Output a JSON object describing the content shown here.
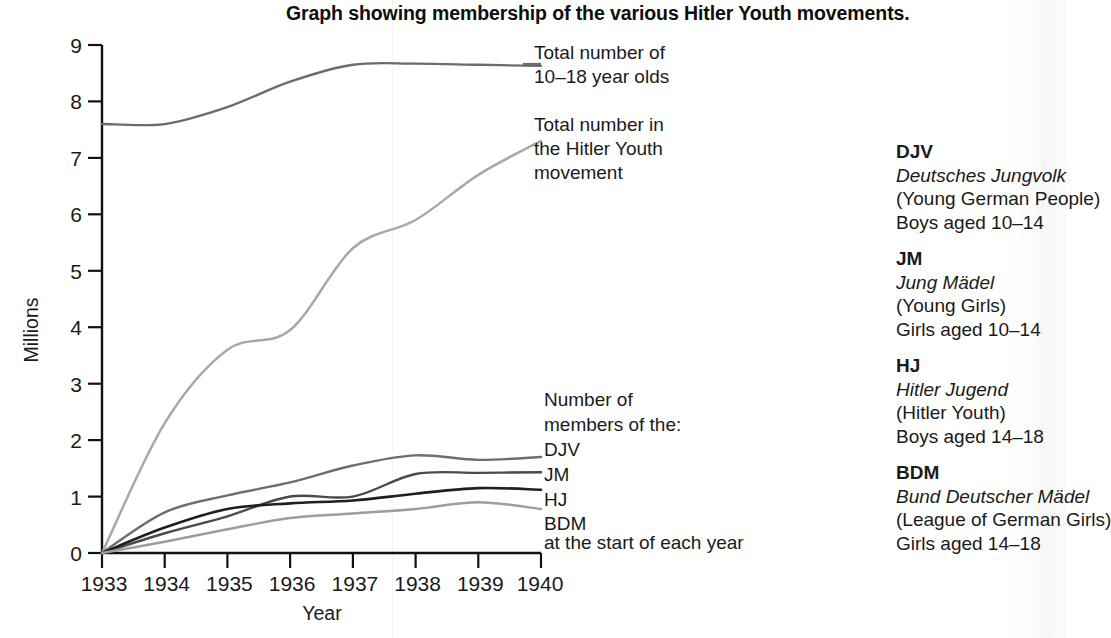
{
  "title": "Graph showing membership of the various Hitler Youth movements.",
  "axes": {
    "ylabel": "Millions",
    "xlabel": "Year",
    "yticks": [
      "0",
      "1",
      "2",
      "3",
      "4",
      "5",
      "6",
      "7",
      "8",
      "9"
    ],
    "xticks": [
      "1933",
      "1934",
      "1935",
      "1936",
      "1937",
      "1938",
      "1939",
      "1940"
    ]
  },
  "annotations": {
    "total_age_group": "Total number of\n10–18 year olds",
    "total_hitler_youth": "Total number in\nthe Hitler Youth\nmovement",
    "members_heading": "Number of\nmembers of the:",
    "members_footer": "at the start of each year",
    "series_labels": [
      "DJV",
      "JM",
      "HJ",
      "BDM"
    ]
  },
  "legend": [
    {
      "abbr": "DJV",
      "german": "Deutsches Jungvolk",
      "english": "(Young German People)",
      "ages": "Boys aged 10–14"
    },
    {
      "abbr": "JM",
      "german": "Jung Mädel",
      "english": "(Young Girls)",
      "ages": "Girls aged 10–14"
    },
    {
      "abbr": "HJ",
      "german": "Hitler Jugend",
      "english": "(Hitler Youth)",
      "ages": "Boys aged 14–18"
    },
    {
      "abbr": "BDM",
      "german": "Bund Deutscher Mädel",
      "english": "(League of German Girls)",
      "ages": "Girls aged 14–18"
    }
  ],
  "colors": {
    "total_age_group": "#6b6b6b",
    "total_hitler_youth": "#a8a8a8",
    "djv": "#6e6e6e",
    "jm": "#4a4a4a",
    "hj": "#1f1f1f",
    "bdm": "#9d9d9d",
    "axis": "#111111",
    "text": "#1a1a1a"
  },
  "chart_data": {
    "type": "line",
    "title": "Graph showing membership of the various Hitler Youth movements.",
    "xlabel": "Year",
    "ylabel": "Millions",
    "xlim": [
      1933,
      1940
    ],
    "ylim": [
      0,
      9
    ],
    "grid": false,
    "legend_position": "inline-right",
    "x": [
      1933,
      1934,
      1935,
      1936,
      1937,
      1938,
      1939,
      1940
    ],
    "series": [
      {
        "name": "Total number of 10–18 year olds",
        "color": "#6b6b6b",
        "values": [
          7.6,
          7.6,
          7.9,
          8.35,
          8.65,
          8.67,
          8.65,
          8.63
        ]
      },
      {
        "name": "Total number in the Hitler Youth movement",
        "color": "#a8a8a8",
        "values": [
          0.0,
          2.3,
          3.6,
          3.95,
          5.4,
          5.9,
          6.7,
          7.3
        ]
      },
      {
        "name": "DJV",
        "color": "#6e6e6e",
        "values": [
          0.0,
          0.72,
          1.02,
          1.25,
          1.55,
          1.73,
          1.65,
          1.7
        ]
      },
      {
        "name": "JM",
        "color": "#4a4a4a",
        "values": [
          0.0,
          0.35,
          0.65,
          1.0,
          1.0,
          1.4,
          1.42,
          1.43
        ]
      },
      {
        "name": "HJ",
        "color": "#1f1f1f",
        "values": [
          0.0,
          0.45,
          0.78,
          0.88,
          0.93,
          1.05,
          1.15,
          1.12
        ]
      },
      {
        "name": "BDM",
        "color": "#9d9d9d",
        "values": [
          0.0,
          0.2,
          0.42,
          0.62,
          0.7,
          0.78,
          0.9,
          0.78
        ]
      }
    ],
    "note": "Values are membership at the start of each year, in millions."
  }
}
